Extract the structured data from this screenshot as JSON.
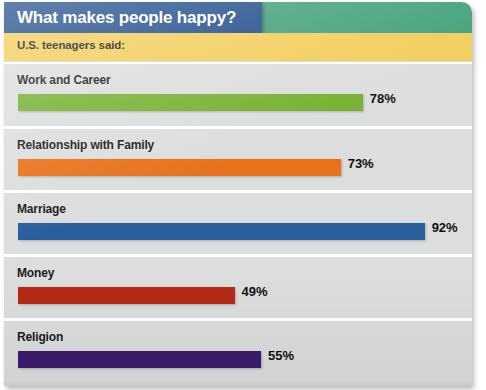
{
  "header": {
    "title": "What makes people happy?",
    "subtitle": "U.S. teenagers said:",
    "title_band_color": "#1d4b88",
    "accent_band_color": "#3f9f78",
    "subtitle_band_color": "#f2cd59"
  },
  "chart_data": {
    "type": "bar",
    "orientation": "horizontal",
    "title": "What makes people happy?",
    "subtitle": "U.S. teenagers said:",
    "xlabel": "",
    "ylabel": "",
    "xlim": [
      0,
      100
    ],
    "unit": "%",
    "grid": false,
    "legend": "none",
    "categories": [
      "Work and Career",
      "Relationship with Family",
      "Marriage",
      "Money",
      "Religion"
    ],
    "values": [
      78,
      73,
      92,
      49,
      55
    ],
    "value_labels": [
      "78%",
      "73%",
      "92%",
      "49%",
      "55%"
    ],
    "colors": [
      "#76b031",
      "#e8711a",
      "#2a5e9e",
      "#b52a16",
      "#3e1b6e"
    ]
  },
  "rows": [
    {
      "label": "Work and Career",
      "value": 78,
      "value_label": "78%",
      "color": "#76b031"
    },
    {
      "label": "Relationship with Family",
      "value": 73,
      "value_label": "73%",
      "color": "#e8711a"
    },
    {
      "label": "Marriage",
      "value": 92,
      "value_label": "92%",
      "color": "#2a5e9e"
    },
    {
      "label": "Money",
      "value": 49,
      "value_label": "49%",
      "color": "#b52a16"
    },
    {
      "label": "Religion",
      "value": 55,
      "value_label": "55%",
      "color": "#3e1b6e"
    }
  ]
}
